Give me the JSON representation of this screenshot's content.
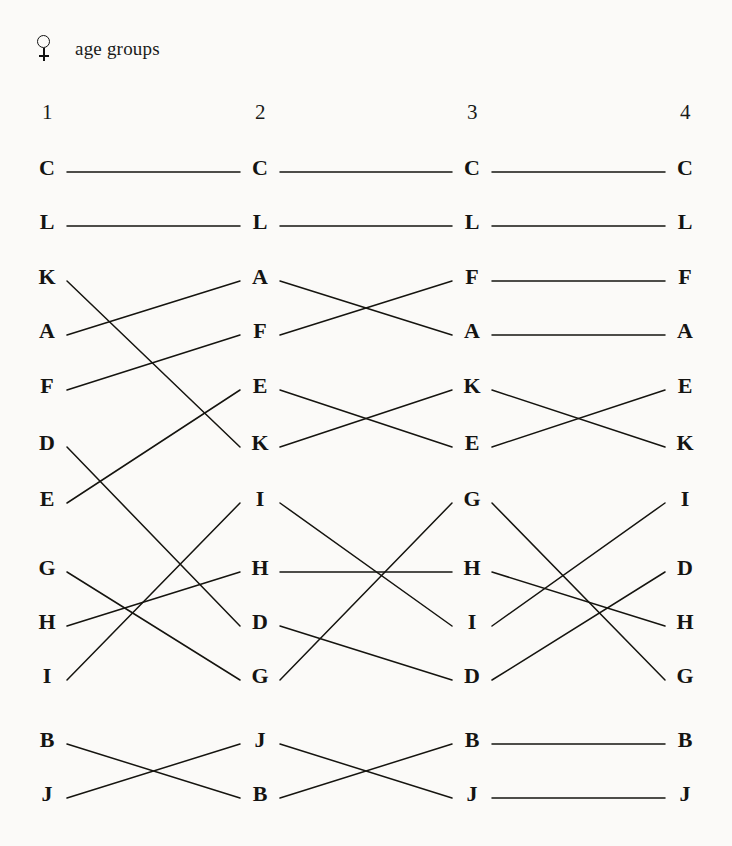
{
  "header": {
    "symbol_icon": "venus-female-icon",
    "label": "age groups"
  },
  "columns": [
    {
      "header": "1",
      "x": 47
    },
    {
      "header": "2",
      "x": 260
    },
    {
      "header": "3",
      "x": 472
    },
    {
      "header": "4",
      "x": 685
    }
  ],
  "chart_data": {
    "type": "table",
    "title": "age groups",
    "subtitle": "",
    "xlabel": "age groups",
    "ylabel": "rank",
    "grid": false,
    "legend": "none",
    "column_labels": [
      "1",
      "2",
      "3",
      "4"
    ],
    "row_positions": [
      168,
      222,
      277,
      331,
      386,
      443,
      499,
      568,
      622,
      676,
      740,
      794
    ],
    "groups": [
      {
        "rows": [
          0,
          1
        ]
      },
      {
        "rows": [
          2,
          3,
          4,
          5
        ]
      },
      {
        "rows": [
          6,
          7,
          8,
          9
        ]
      },
      {
        "rows": [
          10,
          11
        ]
      }
    ],
    "rankings": [
      [
        "C",
        "L",
        "K",
        "A",
        "F",
        "D",
        "E",
        "G",
        "H",
        "I",
        "B",
        "J"
      ],
      [
        "C",
        "L",
        "A",
        "F",
        "E",
        "K",
        "I",
        "H",
        "D",
        "G",
        "J",
        "B"
      ],
      [
        "C",
        "L",
        "F",
        "A",
        "K",
        "E",
        "G",
        "H",
        "I",
        "D",
        "B",
        "J"
      ],
      [
        "C",
        "L",
        "F",
        "A",
        "E",
        "K",
        "I",
        "D",
        "H",
        "G",
        "B",
        "J"
      ]
    ],
    "items": [
      "A",
      "B",
      "C",
      "D",
      "E",
      "F",
      "G",
      "H",
      "I",
      "J",
      "K",
      "L"
    ],
    "link_style": "straight-line",
    "link_color": "#15140f"
  },
  "geometry": {
    "link_start_offset": 20,
    "link_end_offset": 20,
    "width": 732,
    "height": 846
  }
}
